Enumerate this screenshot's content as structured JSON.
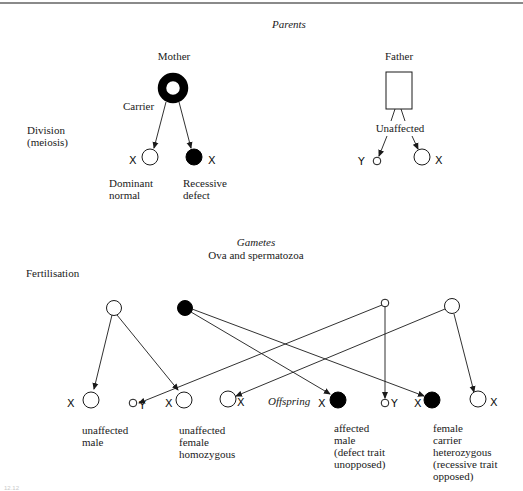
{
  "headings": {
    "parents": "Parents",
    "gametes": "Gametes",
    "gametes_sub": "Ova and spermatozoa",
    "offspring": "Offspring"
  },
  "row_labels": {
    "division": [
      "Division",
      "(meiosis)"
    ],
    "fertilisation": "Fertilisation"
  },
  "parents": {
    "mother": {
      "label": "Mother",
      "status": "Carrier",
      "symbol": "carrier-female-ring"
    },
    "father": {
      "label": "Father",
      "status": "Unaffected",
      "symbol": "male-rectangle"
    }
  },
  "gametes": {
    "mother": [
      {
        "chromosome": "X",
        "type": "normal",
        "caption": [
          "Dominant",
          "normal"
        ]
      },
      {
        "chromosome": "X",
        "type": "defect",
        "caption": [
          "Recessive",
          "defect"
        ]
      }
    ],
    "father": [
      {
        "chromosome": "Y",
        "type": "normal-small"
      },
      {
        "chromosome": "X",
        "type": "normal"
      }
    ]
  },
  "offspring": [
    {
      "pair": [
        "X",
        "Y"
      ],
      "caption": [
        "unaffected",
        "male"
      ]
    },
    {
      "pair": [
        "X",
        "X"
      ],
      "caption": [
        "unaffected",
        "female",
        "homozygous"
      ]
    },
    {
      "pair": [
        "X",
        "Y"
      ],
      "caption": [
        "affected",
        "male",
        "(defect trait",
        "unopposed)"
      ]
    },
    {
      "pair": [
        "X",
        "X"
      ],
      "caption": [
        "female",
        "carrier",
        "heterozygous",
        "(recessive trait",
        "opposed)"
      ]
    }
  ],
  "offspring_markers": {
    "m1": "X",
    "m2": "Y",
    "m3": "X",
    "m4": "X",
    "m5": "X",
    "m6": "Y",
    "m7": "X",
    "m8": "X"
  },
  "figure_number": "12.12"
}
